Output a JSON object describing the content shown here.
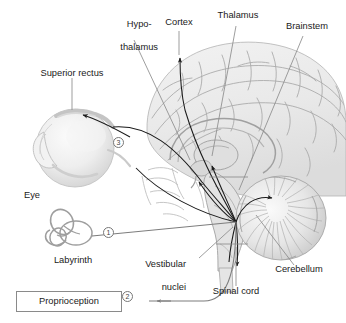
{
  "figure": {
    "colors": {
      "text": "#1a1a1a",
      "arrow_dark": "#1a1a1a",
      "leader_gray": "#7d7d7d",
      "brain_fill": "#ececec",
      "brain_line": "#9a9a9a",
      "box_border": "#8a8a8a",
      "background": "#ffffff"
    }
  },
  "labels": {
    "hypothalamus": {
      "line1": "Hypo-",
      "line2": "thalamus"
    },
    "cortex": "Cortex",
    "thalamus": "Thalamus",
    "brainstem": "Brainstem",
    "superior_rectus": "Superior rectus",
    "eye": "Eye",
    "labyrinth": "Labyrinth",
    "vestibular_nuclei": {
      "line1": "Vestibular",
      "line2": "nuclei"
    },
    "cerebellum": "Cerebellum",
    "spinal_cord": "Spinal cord",
    "proprioception": "Proprioception"
  },
  "markers": [
    {
      "id": "marker-1",
      "symbol": "①",
      "label": "1",
      "source": "Labyrinth"
    },
    {
      "id": "marker-2",
      "symbol": "②",
      "label": "2",
      "source": "Proprioception"
    },
    {
      "id": "marker-3",
      "symbol": "③",
      "label": "3",
      "source": "Eye"
    }
  ],
  "structures": [
    {
      "name": "cerebral-cortex",
      "kind": "brain-region"
    },
    {
      "name": "thalamus",
      "kind": "brain-region"
    },
    {
      "name": "hypothalamus",
      "kind": "brain-region"
    },
    {
      "name": "brainstem",
      "kind": "brain-region"
    },
    {
      "name": "cerebellum",
      "kind": "brain-region"
    },
    {
      "name": "spinal-cord",
      "kind": "brain-region"
    },
    {
      "name": "vestibular-nuclei",
      "kind": "nucleus-hub"
    },
    {
      "name": "eye",
      "kind": "sensory-organ"
    },
    {
      "name": "superior-rectus-muscle",
      "kind": "muscle"
    },
    {
      "name": "labyrinth",
      "kind": "sensory-organ"
    },
    {
      "name": "proprioception",
      "kind": "input-box"
    }
  ]
}
